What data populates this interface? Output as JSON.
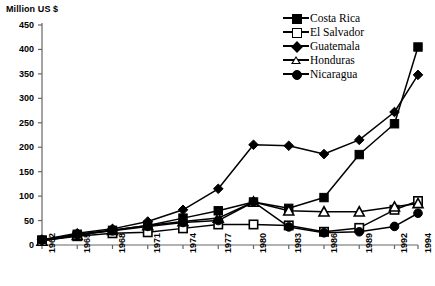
{
  "axis_label": "Million US $",
  "legend": {
    "position": "top-right",
    "entries": [
      {
        "label": "Costa Rica",
        "marker": "filled-square-marker"
      },
      {
        "label": "El Salvador",
        "marker": "open-square-marker"
      },
      {
        "label": "Guatemala",
        "marker": "filled-diamond-marker"
      },
      {
        "label": "Honduras",
        "marker": "open-triangle-marker"
      },
      {
        "label": "Nicaragua",
        "marker": "filled-circle-marker"
      }
    ]
  },
  "chart_data": {
    "type": "line",
    "title": "",
    "xlabel": "",
    "ylabel": "Million US $",
    "ylim": [
      0,
      450
    ],
    "ytick_step": 50,
    "yticks": [
      0,
      50,
      100,
      150,
      200,
      250,
      300,
      350,
      400,
      450
    ],
    "grid": false,
    "categories": [
      "1962",
      "1965",
      "1968",
      "1971",
      "1974",
      "1977",
      "1980",
      "1983",
      "1986",
      "1989",
      "1992",
      "1994"
    ],
    "x": [
      1962,
      1965,
      1968,
      1971,
      1974,
      1977,
      1980,
      1983,
      1986,
      1989,
      1992,
      1994
    ],
    "series": [
      {
        "name": "Costa Rica",
        "marker": "filled-square",
        "filled": true,
        "values": [
          10,
          22,
          30,
          40,
          55,
          70,
          88,
          75,
          97,
          185,
          248,
          405
        ]
      },
      {
        "name": "El Salvador",
        "marker": "open-square",
        "filled": false,
        "values": [
          9,
          18,
          24,
          26,
          34,
          42,
          42,
          40,
          27,
          35,
          72,
          90
        ]
      },
      {
        "name": "Guatemala",
        "marker": "filled-diamond",
        "filled": true,
        "values": [
          11,
          24,
          33,
          48,
          72,
          115,
          205,
          203,
          186,
          215,
          272,
          348
        ]
      },
      {
        "name": "Honduras",
        "marker": "open-triangle",
        "filled": false,
        "values": [
          8,
          20,
          30,
          40,
          48,
          55,
          88,
          70,
          68,
          68,
          78,
          85
        ]
      },
      {
        "name": "Nicaragua",
        "marker": "filled-circle",
        "filled": true,
        "values": [
          10,
          21,
          29,
          38,
          46,
          50,
          88,
          37,
          25,
          27,
          38,
          65
        ]
      }
    ]
  }
}
